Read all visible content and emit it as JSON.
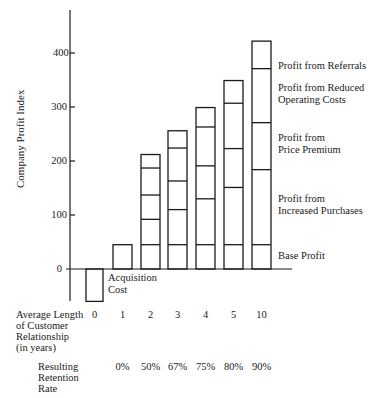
{
  "chart_data": {
    "type": "bar",
    "stacked": true,
    "title": "",
    "xlabel": "Average Length of Customer Relationship (in years)",
    "ylabel": "Company Profit Index",
    "ylim": [
      -70,
      440
    ],
    "yticks": [
      0,
      100,
      200,
      300,
      400
    ],
    "grid": false,
    "categories": [
      "0",
      "1",
      "2",
      "3",
      "4",
      "5",
      "10"
    ],
    "retention_rates": [
      "",
      "0%",
      "50%",
      "67%",
      "75%",
      "80%",
      "90%"
    ],
    "bars": [
      {
        "year": "0",
        "boundaries": [
          0,
          -60
        ],
        "annotation": "Acquisition Cost"
      },
      {
        "year": "1",
        "boundaries": [
          0,
          45
        ]
      },
      {
        "year": "2",
        "boundaries": [
          0,
          45,
          92,
          137,
          187,
          212
        ]
      },
      {
        "year": "3",
        "boundaries": [
          0,
          45,
          110,
          163,
          224,
          256
        ]
      },
      {
        "year": "4",
        "boundaries": [
          0,
          45,
          130,
          191,
          263,
          299
        ]
      },
      {
        "year": "5",
        "boundaries": [
          0,
          45,
          151,
          223,
          307,
          349
        ]
      },
      {
        "year": "10",
        "boundaries": [
          0,
          45,
          184,
          271,
          371,
          422
        ]
      }
    ],
    "series": [
      {
        "name": "Base Profit"
      },
      {
        "name": "Profit from Increased Purchases"
      },
      {
        "name": "Profit from Price Premium"
      },
      {
        "name": "Profit from Reduced Operating Costs"
      },
      {
        "name": "Profit from Referrals"
      }
    ],
    "legend_position": "right, aligned with segments of the year-10 bar"
  },
  "labels": {
    "ylabel": "Company Profit Index",
    "yticks": [
      "400",
      "300",
      "200",
      "100",
      "0"
    ],
    "acquisition": [
      "Acquisition",
      "Cost"
    ],
    "xaxis_title": [
      "Average Length",
      "of Customer",
      "Relationship",
      "(in years)"
    ],
    "retention_title": [
      "Resulting",
      "Retention",
      "Rate"
    ],
    "legend": {
      "referrals": [
        "Profit from Referrals"
      ],
      "reduced_costs": [
        "Profit from Reduced",
        "Operating Costs"
      ],
      "price_premium": [
        "Profit from",
        "Price Premium"
      ],
      "increased_purchases": [
        "Profit from",
        "Increased Purchases"
      ],
      "base": [
        "Base Profit"
      ]
    }
  }
}
